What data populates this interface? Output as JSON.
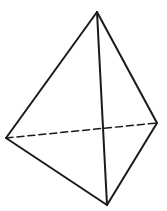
{
  "diagram": {
    "type": "tetrahedron",
    "stroke_color": "#1a1a1a",
    "background": "#ffffff",
    "vertices": {
      "top": [
        97,
        12
      ],
      "left": [
        6,
        138
      ],
      "right": [
        157,
        123
      ],
      "bottom": [
        107,
        205
      ]
    },
    "edges": [
      {
        "from": "top",
        "to": "left",
        "style": "solid"
      },
      {
        "from": "top",
        "to": "right",
        "style": "solid"
      },
      {
        "from": "top",
        "to": "bottom",
        "style": "solid"
      },
      {
        "from": "left",
        "to": "bottom",
        "style": "solid"
      },
      {
        "from": "right",
        "to": "bottom",
        "style": "solid"
      },
      {
        "from": "left",
        "to": "right",
        "style": "dashed"
      }
    ]
  }
}
